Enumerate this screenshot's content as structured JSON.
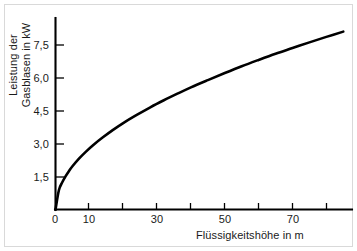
{
  "chart_data": {
    "type": "line",
    "title": "",
    "xlabel": "Flüssigkeitshöhe in m",
    "ylabel_line1": "Leistung der",
    "ylabel_line2": "Gasblasen in kW",
    "ylabel": "Leistung der Gasblasen in kW",
    "xlim": [
      0,
      88
    ],
    "ylim": [
      0,
      8.6
    ],
    "grid": false,
    "legend": false,
    "x_major_ticks": [
      0,
      10,
      30,
      50,
      70
    ],
    "x_major_tick_labels": [
      "0",
      "10",
      "30",
      "50",
      "70"
    ],
    "x_minor_ticks": [
      20,
      40,
      60,
      80
    ],
    "y_major_ticks": [
      1.5,
      3.0,
      4.5,
      6.0,
      7.5
    ],
    "y_major_tick_labels": [
      "1,5",
      "3,0",
      "4,5",
      "6,0",
      "7,5"
    ],
    "series": [
      {
        "name": "Leistung der Gasblasen",
        "x": [
          0,
          1,
          2,
          3,
          4,
          5,
          7,
          9,
          11,
          14,
          17,
          20,
          24,
          28,
          32,
          36,
          40,
          45,
          50,
          55,
          60,
          65,
          70,
          75,
          80,
          85
        ],
        "values": [
          0.0,
          0.88,
          1.24,
          1.52,
          1.76,
          1.97,
          2.33,
          2.64,
          2.92,
          3.29,
          3.63,
          3.94,
          4.31,
          4.66,
          4.98,
          5.28,
          5.57,
          5.9,
          6.22,
          6.53,
          6.82,
          7.1,
          7.36,
          7.62,
          7.87,
          8.11
        ],
        "curve_model": "P = 0.88 * sqrt(h)",
        "color": "#000000"
      }
    ]
  },
  "axes": {
    "x_axis_name": "liquid-height-axis",
    "y_axis_name": "gas-bubble-power-axis"
  },
  "colors": {
    "curve": "#000000",
    "axis": "#000000",
    "background": "#ffffff",
    "frame": "#d9d9d9",
    "text": "#1a1a1a"
  }
}
